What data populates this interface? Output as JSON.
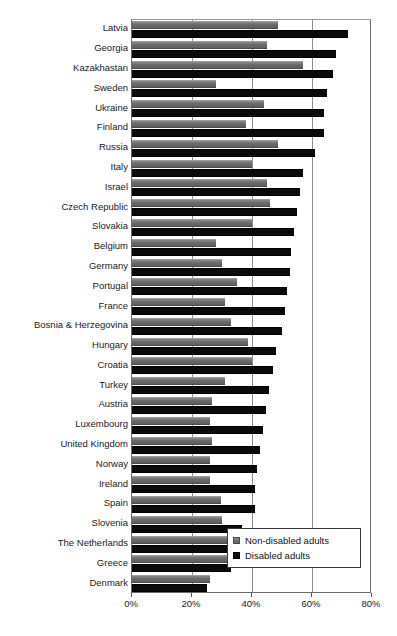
{
  "chart_data": {
    "type": "bar",
    "orientation": "horizontal",
    "title": "",
    "subtitle": "",
    "xlabel": "",
    "ylabel": "",
    "xlim": [
      0,
      80
    ],
    "xticks": [
      0,
      20,
      40,
      60,
      80
    ],
    "xtick_labels": [
      "0%",
      "20%",
      "40%",
      "60%",
      "80%"
    ],
    "grid": "vertical gridlines at 20%, 40%, 60%",
    "legend_position": "bottom-right inside plot",
    "categories": [
      "Latvia",
      "Georgia",
      "Kazakhastan",
      "Sweden",
      "Ukraine",
      "Finland",
      "Russia",
      "Italy",
      "Israel",
      "Czech Republic",
      "Slovakia",
      "Belgium",
      "Germany",
      "Portugal",
      "France",
      "Bosnia & Herzegovina",
      "Hungary",
      "Croatia",
      "Turkey",
      "Austria",
      "Luxembourg",
      "United Kingdom",
      "Norway",
      "Ireland",
      "Spain",
      "Slovenia",
      "The Netherlands",
      "Greece",
      "Denmark"
    ],
    "series": [
      {
        "name": "Non-disabled adults",
        "color": "#6e6e6e",
        "values": [
          48.5,
          45.0,
          57.0,
          28.0,
          44.0,
          38.0,
          48.5,
          40.0,
          45.0,
          46.0,
          40.0,
          28.0,
          30.0,
          35.0,
          31.0,
          33.0,
          38.5,
          40.0,
          31.0,
          26.5,
          26.0,
          26.5,
          26.0,
          26.0,
          29.5,
          30.0,
          33.5,
          36.0,
          26.0
        ]
      },
      {
        "name": "Disabled adults",
        "color": "#0a0a0a",
        "values": [
          72.0,
          68.0,
          67.0,
          65.0,
          64.0,
          64.0,
          61.0,
          57.0,
          56.0,
          55.0,
          54.0,
          53.0,
          52.5,
          51.5,
          51.0,
          50.0,
          48.0,
          47.0,
          45.5,
          44.5,
          43.5,
          42.5,
          41.5,
          41.0,
          41.0,
          36.5,
          34.0,
          33.0,
          25.0
        ]
      }
    ]
  },
  "legend": {
    "items": [
      {
        "label": "Non-disabled adults",
        "swatch": "gray-swatch"
      },
      {
        "label": "Disabled adults",
        "swatch": "black-swatch"
      }
    ]
  }
}
